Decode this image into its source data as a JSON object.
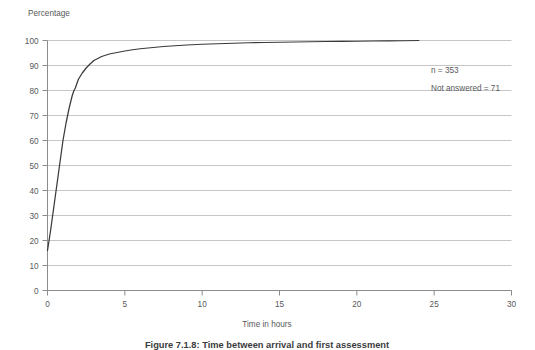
{
  "figure": {
    "caption": "Figure 7.1.8: Time between arrival and first assessment"
  },
  "annotations": {
    "n_label": "n = 353",
    "not_answered_label": "Not answered = 71"
  },
  "colors": {
    "curve": "#3a3a3a",
    "gridline": "#b7b7b7",
    "axis": "#8c8c8c",
    "text": "#58595b",
    "background": "#ffffff"
  },
  "chart_data": {
    "type": "line",
    "title": "",
    "subtitle": "",
    "ylabel": "Percentage",
    "xlabel": "Time in hours",
    "xlim": [
      0,
      30
    ],
    "ylim": [
      0,
      100
    ],
    "grid": true,
    "legend": null,
    "xticks": [
      0,
      5,
      10,
      15,
      20,
      25,
      30
    ],
    "xtick_labels": [
      "0",
      "5",
      "10",
      "15",
      "20",
      "25",
      "30"
    ],
    "yticks": [
      0,
      10,
      20,
      30,
      40,
      50,
      60,
      70,
      80,
      90,
      100
    ],
    "ytick_labels": [
      "0",
      "10",
      "20",
      "30",
      "40",
      "50",
      "60",
      "70",
      "80",
      "90",
      "100"
    ],
    "series": [
      {
        "name": "Cumulative percentage assessed",
        "x": [
          0.0,
          0.1,
          0.2,
          0.3,
          0.4,
          0.5,
          0.6,
          0.7,
          0.8,
          0.9,
          1.0,
          1.1,
          1.2,
          1.3,
          1.4,
          1.5,
          1.6,
          1.7,
          1.8,
          1.9,
          2.0,
          2.25,
          2.5,
          2.75,
          3.0,
          3.5,
          4.0,
          4.5,
          5.0,
          5.5,
          6.0,
          6.5,
          7.0,
          7.5,
          8.0,
          9.0,
          10.0,
          11.0,
          12.0,
          13.0,
          14.0,
          15.0,
          16.0,
          17.0,
          18.0,
          19.0,
          20.0,
          21.0,
          22.0,
          23.0,
          24.0
        ],
        "y": [
          16.0,
          20.0,
          24.0,
          28.5,
          33.0,
          37.5,
          42.0,
          46.5,
          51.0,
          55.5,
          60.0,
          63.5,
          67.0,
          70.0,
          73.0,
          75.5,
          78.0,
          79.8,
          81.0,
          82.8,
          84.5,
          87.0,
          89.0,
          90.6,
          92.0,
          93.6,
          94.6,
          95.2,
          95.8,
          96.3,
          96.7,
          97.0,
          97.3,
          97.6,
          97.8,
          98.2,
          98.5,
          98.7,
          98.9,
          99.1,
          99.2,
          99.3,
          99.4,
          99.5,
          99.6,
          99.65,
          99.7,
          99.8,
          99.85,
          99.9,
          100.0
        ]
      }
    ]
  }
}
